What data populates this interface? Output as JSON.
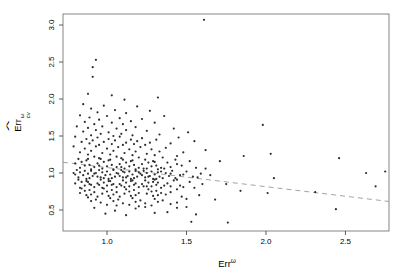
{
  "figure": {
    "background": "#ffffff"
  },
  "chart_data": {
    "type": "scatter",
    "title": "",
    "xlabel": {
      "base": "Err",
      "sup": "ω"
    },
    "ylabel": {
      "base": "Err",
      "hat": "^",
      "sup": "ω",
      "sub": "cv"
    },
    "x_ticks": [
      {
        "v": 1.0,
        "label": "1.0"
      },
      {
        "v": 1.5,
        "label": "1.5"
      },
      {
        "v": 2.0,
        "label": "2.0"
      },
      {
        "v": 2.5,
        "label": "2.5"
      }
    ],
    "y_ticks": [
      {
        "v": 0.5,
        "label": "0.5"
      },
      {
        "v": 1.0,
        "label": "1.0"
      },
      {
        "v": 1.5,
        "label": "1.5"
      },
      {
        "v": 2.0,
        "label": "2.0"
      },
      {
        "v": 2.5,
        "label": "2.5"
      },
      {
        "v": 3.0,
        "label": "3.0"
      }
    ],
    "xlim": [
      0.723,
      2.774
    ],
    "ylim": [
      0.216,
      3.149
    ],
    "grid": false,
    "legend": null,
    "point_color": "#2e2e2e",
    "frame_color": "#666666",
    "tick_color": "#333333",
    "trend_line": {
      "x1": 0.723,
      "y1": 1.145,
      "x2": 2.774,
      "y2": 0.615,
      "color": "#999999",
      "style": "dashed"
    },
    "points": [
      [
        1.61,
        3.07
      ],
      [
        0.93,
        2.53
      ],
      [
        0.91,
        2.43
      ],
      [
        0.91,
        2.3
      ],
      [
        0.88,
        2.07
      ],
      [
        1.03,
        2.05
      ],
      [
        1.32,
        2.02
      ],
      [
        1.11,
        1.99
      ],
      [
        0.85,
        1.93
      ],
      [
        0.98,
        1.91
      ],
      [
        1.19,
        1.9
      ],
      [
        0.9,
        1.87
      ],
      [
        1.05,
        1.85
      ],
      [
        1.27,
        1.84
      ],
      [
        0.94,
        1.82
      ],
      [
        1.12,
        1.81
      ],
      [
        0.83,
        1.78
      ],
      [
        1.0,
        1.77
      ],
      [
        1.36,
        1.77
      ],
      [
        0.89,
        1.75
      ],
      [
        1.08,
        1.74
      ],
      [
        1.22,
        1.73
      ],
      [
        0.95,
        1.72
      ],
      [
        1.15,
        1.7
      ],
      [
        0.86,
        1.69
      ],
      [
        1.03,
        1.68
      ],
      [
        1.3,
        1.68
      ],
      [
        0.92,
        1.66
      ],
      [
        1.1,
        1.66
      ],
      [
        1.98,
        1.65
      ],
      [
        0.81,
        1.63
      ],
      [
        0.97,
        1.63
      ],
      [
        1.18,
        1.62
      ],
      [
        0.88,
        1.61
      ],
      [
        1.06,
        1.6
      ],
      [
        1.42,
        1.6
      ],
      [
        0.93,
        1.58
      ],
      [
        1.12,
        1.58
      ],
      [
        1.25,
        1.57
      ],
      [
        0.85,
        1.56
      ],
      [
        1.01,
        1.55
      ],
      [
        1.51,
        1.55
      ],
      [
        0.96,
        1.53
      ],
      [
        1.09,
        1.53
      ],
      [
        1.33,
        1.52
      ],
      [
        0.9,
        1.51
      ],
      [
        1.16,
        1.51
      ],
      [
        1.04,
        1.5
      ],
      [
        0.8,
        1.49
      ],
      [
        0.94,
        1.48
      ],
      [
        1.08,
        1.49
      ],
      [
        1.22,
        1.47
      ],
      [
        1.45,
        1.48
      ],
      [
        0.87,
        1.46
      ],
      [
        1.01,
        1.46
      ],
      [
        1.15,
        1.45
      ],
      [
        1.31,
        1.45
      ],
      [
        0.91,
        1.44
      ],
      [
        1.05,
        1.44
      ],
      [
        1.19,
        1.43
      ],
      [
        1.55,
        1.43
      ],
      [
        0.84,
        1.42
      ],
      [
        0.98,
        1.42
      ],
      [
        1.12,
        1.41
      ],
      [
        1.27,
        1.41
      ],
      [
        1.4,
        1.4
      ],
      [
        0.89,
        1.4
      ],
      [
        1.03,
        1.39
      ],
      [
        1.17,
        1.39
      ],
      [
        0.95,
        1.38
      ],
      [
        1.1,
        1.38
      ],
      [
        1.24,
        1.38
      ],
      [
        0.79,
        1.36
      ],
      [
        0.93,
        1.36
      ],
      [
        1.07,
        1.35
      ],
      [
        1.21,
        1.35
      ],
      [
        1.37,
        1.34
      ],
      [
        0.86,
        1.33
      ],
      [
        1.0,
        1.33
      ],
      [
        1.14,
        1.32
      ],
      [
        1.28,
        1.32
      ],
      [
        1.62,
        1.31
      ],
      [
        0.9,
        1.3
      ],
      [
        1.04,
        1.3
      ],
      [
        1.18,
        1.29
      ],
      [
        1.33,
        1.29
      ],
      [
        1.48,
        1.28
      ],
      [
        0.83,
        1.28
      ],
      [
        0.97,
        1.27
      ],
      [
        1.11,
        1.27
      ],
      [
        1.25,
        1.26
      ],
      [
        2.03,
        1.26
      ],
      [
        0.88,
        1.25
      ],
      [
        1.02,
        1.25
      ],
      [
        1.16,
        1.24
      ],
      [
        1.3,
        1.24
      ],
      [
        1.44,
        1.23
      ],
      [
        1.86,
        1.23
      ],
      [
        0.92,
        1.22
      ],
      [
        1.06,
        1.22
      ],
      [
        1.2,
        1.21
      ],
      [
        1.35,
        1.21
      ],
      [
        2.46,
        1.2
      ],
      [
        0.95,
        1.2
      ],
      [
        1.09,
        1.2
      ],
      [
        0.82,
        1.19
      ],
      [
        0.96,
        1.19
      ],
      [
        1.1,
        1.18
      ],
      [
        1.24,
        1.18
      ],
      [
        1.43,
        1.18
      ],
      [
        0.87,
        1.17
      ],
      [
        1.01,
        1.17
      ],
      [
        1.15,
        1.16
      ],
      [
        1.29,
        1.16
      ],
      [
        1.52,
        1.16
      ],
      [
        0.84,
        1.15
      ],
      [
        0.98,
        1.15
      ],
      [
        1.12,
        1.14
      ],
      [
        1.26,
        1.14
      ],
      [
        1.38,
        1.14
      ],
      [
        0.8,
        1.13
      ],
      [
        0.94,
        1.13
      ],
      [
        1.08,
        1.12
      ],
      [
        1.22,
        1.12
      ],
      [
        1.71,
        1.16
      ],
      [
        0.89,
        1.11
      ],
      [
        1.03,
        1.11
      ],
      [
        1.17,
        1.11
      ],
      [
        1.31,
        1.1
      ],
      [
        1.47,
        1.1
      ],
      [
        0.86,
        1.1
      ],
      [
        1.0,
        1.09
      ],
      [
        1.14,
        1.09
      ],
      [
        1.28,
        1.09
      ],
      [
        1.4,
        1.08
      ],
      [
        0.92,
        1.08
      ],
      [
        1.06,
        1.08
      ],
      [
        1.2,
        1.07
      ],
      [
        1.34,
        1.07
      ],
      [
        1.56,
        1.07
      ],
      [
        0.83,
        1.07
      ],
      [
        0.97,
        1.06
      ],
      [
        1.11,
        1.06
      ],
      [
        1.25,
        1.06
      ],
      [
        1.36,
        1.06
      ],
      [
        0.9,
        1.05
      ],
      [
        1.04,
        1.05
      ],
      [
        1.18,
        1.05
      ],
      [
        1.32,
        1.05
      ],
      [
        2.75,
        1.02
      ],
      [
        0.88,
        1.19
      ],
      [
        1.02,
        1.18
      ],
      [
        1.16,
        1.17
      ],
      [
        1.3,
        1.15
      ],
      [
        1.44,
        1.12
      ],
      [
        0.95,
        1.1
      ],
      [
        1.09,
        1.08
      ],
      [
        1.23,
        1.06
      ],
      [
        1.62,
        1.06
      ],
      [
        2.63,
        1.0
      ],
      [
        0.81,
        1.04
      ],
      [
        0.95,
        1.04
      ],
      [
        1.09,
        1.04
      ],
      [
        1.23,
        1.03
      ],
      [
        1.41,
        1.03
      ],
      [
        0.86,
        1.03
      ],
      [
        1.0,
        1.02
      ],
      [
        1.14,
        1.02
      ],
      [
        1.28,
        1.02
      ],
      [
        1.5,
        1.02
      ],
      [
        0.83,
        1.01
      ],
      [
        0.97,
        1.01
      ],
      [
        1.11,
        1.01
      ],
      [
        1.25,
        1.0
      ],
      [
        1.37,
        1.0
      ],
      [
        0.79,
        1.0
      ],
      [
        0.93,
        1.0
      ],
      [
        1.07,
        0.99
      ],
      [
        1.21,
        0.99
      ],
      [
        1.59,
        0.99
      ],
      [
        0.88,
        0.99
      ],
      [
        1.02,
        0.98
      ],
      [
        1.16,
        0.98
      ],
      [
        1.3,
        0.98
      ],
      [
        1.46,
        0.97
      ],
      [
        0.85,
        0.97
      ],
      [
        0.99,
        0.97
      ],
      [
        1.13,
        0.96
      ],
      [
        1.27,
        0.96
      ],
      [
        1.39,
        0.96
      ],
      [
        0.91,
        0.96
      ],
      [
        1.05,
        0.95
      ],
      [
        1.19,
        0.95
      ],
      [
        1.33,
        0.95
      ],
      [
        1.54,
        0.95
      ],
      [
        0.82,
        0.94
      ],
      [
        0.96,
        0.94
      ],
      [
        1.1,
        0.94
      ],
      [
        1.24,
        0.94
      ],
      [
        1.35,
        0.93
      ],
      [
        0.89,
        0.93
      ],
      [
        1.03,
        0.93
      ],
      [
        1.17,
        0.93
      ],
      [
        1.31,
        0.92
      ],
      [
        1.65,
        0.97
      ],
      [
        0.87,
        0.92
      ],
      [
        1.01,
        0.92
      ],
      [
        1.15,
        0.92
      ],
      [
        1.29,
        0.92
      ],
      [
        1.43,
        0.93
      ],
      [
        0.94,
        0.95
      ],
      [
        1.08,
        0.96
      ],
      [
        1.22,
        0.97
      ],
      [
        1.48,
        0.98
      ],
      [
        2.05,
        0.93
      ],
      [
        0.8,
        0.98
      ],
      [
        0.92,
        0.99
      ],
      [
        1.06,
        1.0
      ],
      [
        1.2,
        1.01
      ],
      [
        1.34,
        1.02
      ],
      [
        0.9,
        1.03
      ],
      [
        1.04,
        1.04
      ],
      [
        1.18,
        1.03
      ],
      [
        1.32,
        1.01
      ],
      [
        1.57,
        0.94
      ],
      [
        0.98,
        0.93
      ],
      [
        1.12,
        0.94
      ],
      [
        1.26,
        0.95
      ],
      [
        1.4,
        0.99
      ],
      [
        1.1,
        1.02
      ],
      [
        0.82,
        0.91
      ],
      [
        0.96,
        0.91
      ],
      [
        1.1,
        0.9
      ],
      [
        1.24,
        0.9
      ],
      [
        1.42,
        0.9
      ],
      [
        0.87,
        0.89
      ],
      [
        1.01,
        0.89
      ],
      [
        1.15,
        0.89
      ],
      [
        1.29,
        0.88
      ],
      [
        1.52,
        0.88
      ],
      [
        0.84,
        0.88
      ],
      [
        0.98,
        0.87
      ],
      [
        1.12,
        0.87
      ],
      [
        1.26,
        0.87
      ],
      [
        1.38,
        0.86
      ],
      [
        0.8,
        0.86
      ],
      [
        0.94,
        0.86
      ],
      [
        1.08,
        0.85
      ],
      [
        1.22,
        0.85
      ],
      [
        1.6,
        0.85
      ],
      [
        0.89,
        0.85
      ],
      [
        1.03,
        0.84
      ],
      [
        1.17,
        0.84
      ],
      [
        1.31,
        0.84
      ],
      [
        1.46,
        0.83
      ],
      [
        0.86,
        0.83
      ],
      [
        1.0,
        0.83
      ],
      [
        1.14,
        0.82
      ],
      [
        1.28,
        0.82
      ],
      [
        1.4,
        0.82
      ],
      [
        0.92,
        0.81
      ],
      [
        1.06,
        0.81
      ],
      [
        1.2,
        0.81
      ],
      [
        1.34,
        0.8
      ],
      [
        1.55,
        0.8
      ],
      [
        0.83,
        0.8
      ],
      [
        0.97,
        0.8
      ],
      [
        1.11,
        0.81
      ],
      [
        1.25,
        0.82
      ],
      [
        1.36,
        0.83
      ],
      [
        0.9,
        0.84
      ],
      [
        1.04,
        0.85
      ],
      [
        1.18,
        0.86
      ],
      [
        1.32,
        0.87
      ],
      [
        1.75,
        0.85
      ],
      [
        0.88,
        0.88
      ],
      [
        1.02,
        0.89
      ],
      [
        1.16,
        0.9
      ],
      [
        1.3,
        0.91
      ],
      [
        1.44,
        0.91
      ],
      [
        0.95,
        0.84
      ],
      [
        1.09,
        0.83
      ],
      [
        1.23,
        0.82
      ],
      [
        1.48,
        0.81
      ],
      [
        2.69,
        0.82
      ],
      [
        0.84,
        0.79
      ],
      [
        0.98,
        0.79
      ],
      [
        1.12,
        0.78
      ],
      [
        1.26,
        0.78
      ],
      [
        1.44,
        0.78
      ],
      [
        0.89,
        0.77
      ],
      [
        1.03,
        0.77
      ],
      [
        1.17,
        0.77
      ],
      [
        1.31,
        0.76
      ],
      [
        1.84,
        0.76
      ],
      [
        0.86,
        0.76
      ],
      [
        1.0,
        0.75
      ],
      [
        1.14,
        0.75
      ],
      [
        1.28,
        0.75
      ],
      [
        1.4,
        0.74
      ],
      [
        0.92,
        0.74
      ],
      [
        1.06,
        0.74
      ],
      [
        1.2,
        0.73
      ],
      [
        1.34,
        0.73
      ],
      [
        2.01,
        0.73
      ],
      [
        0.83,
        0.73
      ],
      [
        0.97,
        0.72
      ],
      [
        1.11,
        0.72
      ],
      [
        1.25,
        0.72
      ],
      [
        1.37,
        0.71
      ],
      [
        0.9,
        0.71
      ],
      [
        1.04,
        0.71
      ],
      [
        1.18,
        0.7
      ],
      [
        1.32,
        0.7
      ],
      [
        1.58,
        0.7
      ],
      [
        0.87,
        0.7
      ],
      [
        1.01,
        0.69
      ],
      [
        1.15,
        0.69
      ],
      [
        1.29,
        0.69
      ],
      [
        1.47,
        0.68
      ],
      [
        0.94,
        0.68
      ],
      [
        1.08,
        0.68
      ],
      [
        2.31,
        0.74
      ],
      [
        0.88,
        0.67
      ],
      [
        1.02,
        0.66
      ],
      [
        1.16,
        0.66
      ],
      [
        1.3,
        0.65
      ],
      [
        1.5,
        0.65
      ],
      [
        0.93,
        0.64
      ],
      [
        1.07,
        0.64
      ],
      [
        1.21,
        0.63
      ],
      [
        1.35,
        0.63
      ],
      [
        1.68,
        0.64
      ],
      [
        0.9,
        0.62
      ],
      [
        1.04,
        0.62
      ],
      [
        1.18,
        0.61
      ],
      [
        1.32,
        0.61
      ],
      [
        1.44,
        0.6
      ],
      [
        0.96,
        0.6
      ],
      [
        1.1,
        0.59
      ],
      [
        1.24,
        0.59
      ],
      [
        1.4,
        0.58
      ],
      [
        1.0,
        0.57
      ],
      [
        1.14,
        0.57
      ],
      [
        1.28,
        0.56
      ],
      [
        1.06,
        0.56
      ],
      [
        1.2,
        0.55
      ],
      [
        0.92,
        0.53
      ],
      [
        1.05,
        0.49
      ],
      [
        1.18,
        0.52
      ],
      [
        1.3,
        0.46
      ],
      [
        1.44,
        0.53
      ],
      [
        1.56,
        0.44
      ],
      [
        1.12,
        0.43
      ],
      [
        0.99,
        0.45
      ],
      [
        1.24,
        0.54
      ],
      [
        2.44,
        0.51
      ],
      [
        1.38,
        0.47
      ],
      [
        1.5,
        0.54
      ],
      [
        1.53,
        0.34
      ],
      [
        1.76,
        0.33
      ]
    ]
  }
}
